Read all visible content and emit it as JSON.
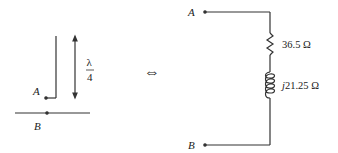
{
  "left": {
    "terminal_a": "A",
    "terminal_b": "B",
    "length_num": "λ",
    "length_den": "4"
  },
  "equivalence_symbol": "⇔",
  "right": {
    "terminal_a": "A",
    "terminal_b": "B",
    "resistor_value": "36.5 Ω",
    "reactance_prefix": "j",
    "reactance_value": "21.25 Ω"
  },
  "colors": {
    "line": "#333333",
    "text": "#222222"
  }
}
